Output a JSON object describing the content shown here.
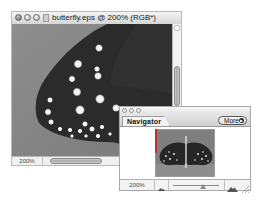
{
  "document_window": {
    "title": "butterfly.eps @ 200% (RGB*)",
    "zoom_level": "200%",
    "traffic_lights": [
      "close-icon",
      "minimize-icon",
      "zoom-icon"
    ],
    "proxy_icon": "document-icon"
  },
  "navigator": {
    "tab_label": "Navigator",
    "more_button_label": "More",
    "more_icon": "triangle-right-icon",
    "zoom_level": "200%",
    "zoom_out_icon": "small-mountain-icon",
    "zoom_in_icon": "large-mountain-icon",
    "view_box_color": "#c03030"
  },
  "colors": {
    "canvas_background": "#8d8d8d",
    "wing": "#2b2b2b",
    "spots": "#f2f2f2"
  }
}
